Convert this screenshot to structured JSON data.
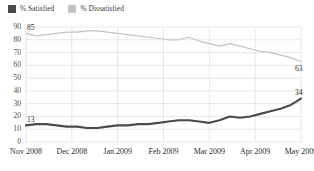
{
  "legend": {
    "items": [
      {
        "label": "% Satisfied",
        "color": "#4a4a4a",
        "name": "satisfied"
      },
      {
        "label": "% Dissatisfied",
        "color": "#c2c2c2",
        "name": "dissatisfied"
      }
    ]
  },
  "labels": {
    "satisfied_start": "13",
    "satisfied_end": "34",
    "dissatisfied_start": "85",
    "dissatisfied_end": "63"
  },
  "chart_data": {
    "type": "line",
    "title": "",
    "xlabel": "",
    "ylabel": "",
    "ylim": [
      0,
      90
    ],
    "yticks": [
      0,
      10,
      20,
      30,
      40,
      50,
      60,
      70,
      80,
      90
    ],
    "grid": true,
    "legend_position": "top-left",
    "xtick_labels": [
      "Nov 2008",
      "Dec 2008",
      "Jan 2009",
      "Feb 2009",
      "Mar 2009",
      "Apr 2009",
      "May 2009"
    ],
    "x_index": [
      0,
      1,
      2,
      3,
      4,
      5,
      6,
      7,
      8,
      9,
      10,
      11,
      12,
      13,
      14,
      15,
      16,
      17,
      18,
      19,
      20,
      21,
      22,
      23,
      24,
      25,
      26,
      27
    ],
    "series": [
      {
        "name": "% Satisfied",
        "color": "#4a4a4a",
        "values": [
          13,
          14,
          14,
          13,
          12,
          12,
          11,
          11,
          12,
          13,
          13,
          14,
          14,
          15,
          16,
          17,
          17,
          16,
          15,
          17,
          20,
          19,
          20,
          22,
          24,
          26,
          29,
          34
        ]
      },
      {
        "name": "% Dissatisfied",
        "color": "#c2c2c2",
        "values": [
          85,
          83,
          84,
          85,
          86,
          86,
          87,
          87,
          86,
          85,
          84,
          83,
          82,
          81,
          80,
          80,
          82,
          79,
          77,
          75,
          77,
          75,
          73,
          71,
          70,
          68,
          66,
          63
        ]
      }
    ]
  }
}
